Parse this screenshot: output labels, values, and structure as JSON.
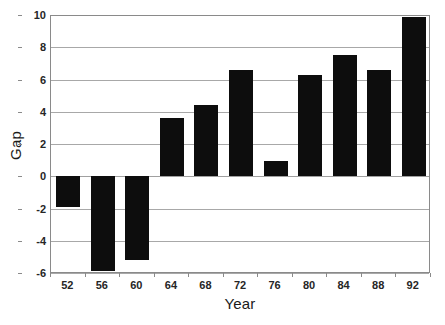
{
  "chart_data": {
    "type": "bar",
    "title": "",
    "xlabel": "Year",
    "ylabel": "Gap",
    "categories": [
      "52",
      "56",
      "60",
      "64",
      "68",
      "72",
      "76",
      "80",
      "84",
      "88",
      "92"
    ],
    "values": [
      -1.9,
      -5.9,
      -5.2,
      3.6,
      4.4,
      6.6,
      0.95,
      6.3,
      7.5,
      6.6,
      9.9
    ],
    "ylim": [
      -6,
      10
    ],
    "ytick_labels": [
      "10",
      "8",
      "6",
      "4",
      "2",
      "0",
      "-2",
      "-4",
      "-6"
    ],
    "ytick_values": [
      10,
      8,
      6,
      4,
      2,
      0,
      -2,
      -4,
      -6
    ],
    "grid": "horizontal",
    "legend": "none",
    "bar_color": "#0d0d0d",
    "background_color": "#ffffff",
    "gridline_color": "#a8a8a8",
    "axis_color": "#8a8a8a"
  }
}
